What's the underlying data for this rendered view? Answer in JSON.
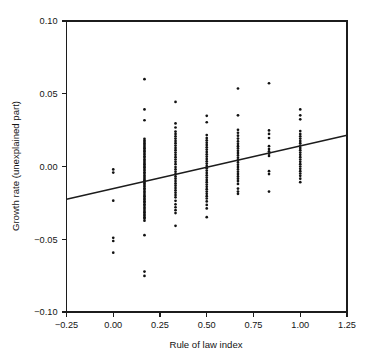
{
  "chart_data": {
    "type": "scatter",
    "title": "",
    "xlabel": "Rule of law index",
    "ylabel": "Growth rate (unexplained part)",
    "xlim": [
      -0.25,
      1.25
    ],
    "ylim": [
      -0.1,
      0.1
    ],
    "xticks": [
      -0.25,
      0.0,
      0.25,
      0.5,
      0.75,
      1.0,
      1.25
    ],
    "xtick_labels": [
      "−0.25",
      "0.00",
      "0.25",
      "0.50",
      "0.75",
      "1.00",
      "1.25"
    ],
    "yticks": [
      -0.1,
      -0.05,
      0.0,
      0.05,
      0.1
    ],
    "ytick_labels": [
      "−0.10",
      "−0.05",
      "0.00",
      "0.05",
      "0.10"
    ],
    "grid": false,
    "legend": null,
    "point_color": "#121212",
    "line_color": "#1c1c1c",
    "marker_size": 1.35,
    "trendline": {
      "name": "fitted regression line",
      "x_start": -0.25,
      "y_start": -0.0225,
      "x_end": 1.25,
      "y_end": 0.0215,
      "slope": 0.02933,
      "intercept": -0.01517
    },
    "series": [
      {
        "name": "Growth rate residual vs rule of law index",
        "points": [
          [
            0.0,
            -0.002
          ],
          [
            0.0,
            -0.0042
          ],
          [
            0.0,
            -0.0235
          ],
          [
            0.0,
            -0.049
          ],
          [
            0.0,
            -0.0512
          ],
          [
            0.0,
            -0.0592
          ],
          [
            0.167,
            0.06
          ],
          [
            0.167,
            0.0392
          ],
          [
            0.167,
            0.0318
          ],
          [
            0.167,
            0.019
          ],
          [
            0.167,
            0.0178
          ],
          [
            0.167,
            0.0168
          ],
          [
            0.167,
            0.0158
          ],
          [
            0.167,
            0.0148
          ],
          [
            0.167,
            0.0136
          ],
          [
            0.167,
            0.0126
          ],
          [
            0.167,
            0.0114
          ],
          [
            0.167,
            0.0104
          ],
          [
            0.167,
            0.0092
          ],
          [
            0.167,
            0.0082
          ],
          [
            0.167,
            0.007
          ],
          [
            0.167,
            0.006
          ],
          [
            0.167,
            0.0048
          ],
          [
            0.167,
            0.0038
          ],
          [
            0.167,
            0.0026
          ],
          [
            0.167,
            0.0016
          ],
          [
            0.167,
            0.0004
          ],
          [
            0.167,
            -0.0006
          ],
          [
            0.167,
            -0.0018
          ],
          [
            0.167,
            -0.0028
          ],
          [
            0.167,
            -0.004
          ],
          [
            0.167,
            -0.005
          ],
          [
            0.167,
            -0.0062
          ],
          [
            0.167,
            -0.0072
          ],
          [
            0.167,
            -0.0084
          ],
          [
            0.167,
            -0.0094
          ],
          [
            0.167,
            -0.0106
          ],
          [
            0.167,
            -0.0116
          ],
          [
            0.167,
            -0.0128
          ],
          [
            0.167,
            -0.0138
          ],
          [
            0.167,
            -0.015
          ],
          [
            0.167,
            -0.016
          ],
          [
            0.167,
            -0.0172
          ],
          [
            0.167,
            -0.0182
          ],
          [
            0.167,
            -0.0194
          ],
          [
            0.167,
            -0.0204
          ],
          [
            0.167,
            -0.0216
          ],
          [
            0.167,
            -0.0226
          ],
          [
            0.167,
            -0.0238
          ],
          [
            0.167,
            -0.0248
          ],
          [
            0.167,
            -0.026
          ],
          [
            0.167,
            -0.027
          ],
          [
            0.167,
            -0.0282
          ],
          [
            0.167,
            -0.0292
          ],
          [
            0.167,
            -0.0304
          ],
          [
            0.167,
            -0.0314
          ],
          [
            0.167,
            -0.0326
          ],
          [
            0.167,
            -0.0336
          ],
          [
            0.167,
            -0.0348
          ],
          [
            0.167,
            -0.0358
          ],
          [
            0.167,
            -0.0372
          ],
          [
            0.167,
            -0.0472
          ],
          [
            0.167,
            -0.0722
          ],
          [
            0.167,
            -0.0752
          ],
          [
            0.333,
            0.0444
          ],
          [
            0.333,
            0.0296
          ],
          [
            0.333,
            0.0268
          ],
          [
            0.333,
            0.024
          ],
          [
            0.333,
            0.0224
          ],
          [
            0.333,
            0.0208
          ],
          [
            0.333,
            0.0192
          ],
          [
            0.333,
            0.0176
          ],
          [
            0.333,
            0.016
          ],
          [
            0.333,
            0.0144
          ],
          [
            0.333,
            0.0128
          ],
          [
            0.333,
            0.0112
          ],
          [
            0.333,
            0.0096
          ],
          [
            0.333,
            0.008
          ],
          [
            0.333,
            0.0064
          ],
          [
            0.333,
            0.0048
          ],
          [
            0.333,
            0.0032
          ],
          [
            0.333,
            0.0016
          ],
          [
            0.333,
            -0.0004
          ],
          [
            0.333,
            -0.002
          ],
          [
            0.333,
            -0.0036
          ],
          [
            0.333,
            -0.0052
          ],
          [
            0.333,
            -0.0068
          ],
          [
            0.333,
            -0.0084
          ],
          [
            0.333,
            -0.01
          ],
          [
            0.333,
            -0.0116
          ],
          [
            0.333,
            -0.0132
          ],
          [
            0.333,
            -0.0148
          ],
          [
            0.333,
            -0.0164
          ],
          [
            0.333,
            -0.018
          ],
          [
            0.333,
            -0.0196
          ],
          [
            0.333,
            -0.0212
          ],
          [
            0.333,
            -0.0236
          ],
          [
            0.333,
            -0.026
          ],
          [
            0.333,
            -0.028
          ],
          [
            0.333,
            -0.03
          ],
          [
            0.333,
            -0.032
          ],
          [
            0.333,
            -0.0408
          ],
          [
            0.5,
            0.0348
          ],
          [
            0.5,
            0.0304
          ],
          [
            0.5,
            0.0216
          ],
          [
            0.5,
            0.0196
          ],
          [
            0.5,
            0.018
          ],
          [
            0.5,
            0.0164
          ],
          [
            0.5,
            0.0148
          ],
          [
            0.5,
            0.0132
          ],
          [
            0.5,
            0.0116
          ],
          [
            0.5,
            0.01
          ],
          [
            0.5,
            0.0084
          ],
          [
            0.5,
            0.0068
          ],
          [
            0.5,
            0.0052
          ],
          [
            0.5,
            0.0036
          ],
          [
            0.5,
            0.002
          ],
          [
            0.5,
            0.0004
          ],
          [
            0.5,
            -0.0012
          ],
          [
            0.5,
            -0.0028
          ],
          [
            0.5,
            -0.0044
          ],
          [
            0.5,
            -0.006
          ],
          [
            0.5,
            -0.0076
          ],
          [
            0.5,
            -0.0092
          ],
          [
            0.5,
            -0.0108
          ],
          [
            0.5,
            -0.0124
          ],
          [
            0.5,
            -0.014
          ],
          [
            0.5,
            -0.0156
          ],
          [
            0.5,
            -0.0172
          ],
          [
            0.5,
            -0.0188
          ],
          [
            0.5,
            -0.0204
          ],
          [
            0.5,
            -0.022
          ],
          [
            0.5,
            -0.024
          ],
          [
            0.5,
            -0.0264
          ],
          [
            0.5,
            -0.0288
          ],
          [
            0.5,
            -0.0348
          ],
          [
            0.667,
            0.0536
          ],
          [
            0.667,
            0.0352
          ],
          [
            0.667,
            0.0252
          ],
          [
            0.667,
            0.0232
          ],
          [
            0.667,
            0.0212
          ],
          [
            0.667,
            0.0192
          ],
          [
            0.667,
            0.0172
          ],
          [
            0.667,
            0.0156
          ],
          [
            0.667,
            0.014
          ],
          [
            0.667,
            0.0124
          ],
          [
            0.667,
            0.0108
          ],
          [
            0.667,
            0.0092
          ],
          [
            0.667,
            0.0076
          ],
          [
            0.667,
            0.006
          ],
          [
            0.667,
            0.0044
          ],
          [
            0.667,
            0.0028
          ],
          [
            0.667,
            0.0012
          ],
          [
            0.667,
            -0.0004
          ],
          [
            0.667,
            -0.002
          ],
          [
            0.667,
            -0.0036
          ],
          [
            0.667,
            -0.0052
          ],
          [
            0.667,
            -0.0068
          ],
          [
            0.667,
            -0.0084
          ],
          [
            0.667,
            -0.01
          ],
          [
            0.667,
            -0.012
          ],
          [
            0.667,
            -0.0152
          ],
          [
            0.667,
            -0.0172
          ],
          [
            0.667,
            -0.0188
          ],
          [
            0.833,
            0.0572
          ],
          [
            0.833,
            0.0248
          ],
          [
            0.833,
            0.0224
          ],
          [
            0.833,
            0.0196
          ],
          [
            0.833,
            0.014
          ],
          [
            0.833,
            0.012
          ],
          [
            0.833,
            0.0104
          ],
          [
            0.833,
            0.0088
          ],
          [
            0.833,
            0.0072
          ],
          [
            0.833,
            -0.0032
          ],
          [
            0.833,
            -0.0052
          ],
          [
            0.833,
            -0.0172
          ],
          [
            1.0,
            0.0392
          ],
          [
            1.0,
            0.0352
          ],
          [
            1.0,
            0.0324
          ],
          [
            1.0,
            0.0244
          ],
          [
            1.0,
            0.0224
          ],
          [
            1.0,
            0.0208
          ],
          [
            1.0,
            0.0192
          ],
          [
            1.0,
            0.0176
          ],
          [
            1.0,
            0.016
          ],
          [
            1.0,
            0.0144
          ],
          [
            1.0,
            0.0128
          ],
          [
            1.0,
            0.0112
          ],
          [
            1.0,
            0.0096
          ],
          [
            1.0,
            0.008
          ],
          [
            1.0,
            0.0064
          ],
          [
            1.0,
            0.0048
          ],
          [
            1.0,
            0.0032
          ],
          [
            1.0,
            0.0016
          ],
          [
            1.0,
            0.0
          ],
          [
            1.0,
            -0.0016
          ],
          [
            1.0,
            -0.0032
          ],
          [
            1.0,
            -0.0048
          ],
          [
            1.0,
            -0.0064
          ],
          [
            1.0,
            -0.0084
          ],
          [
            1.0,
            -0.0108
          ]
        ]
      }
    ]
  }
}
